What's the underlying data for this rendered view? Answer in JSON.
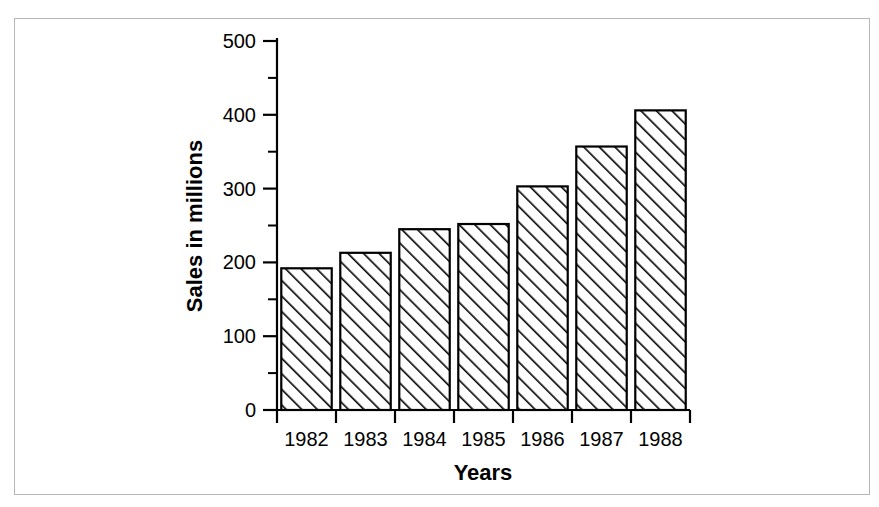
{
  "chart_data": {
    "type": "bar",
    "title": "",
    "xlabel": "Years",
    "ylabel": "Sales in millions",
    "categories": [
      "1982",
      "1983",
      "1984",
      "1985",
      "1986",
      "1987",
      "1988"
    ],
    "values": [
      192,
      213,
      245,
      252,
      303,
      357,
      406
    ],
    "ylim": [
      0,
      500
    ],
    "ytick_labels": [
      "0",
      "100",
      "200",
      "300",
      "400",
      "500"
    ],
    "ytick_values": [
      0,
      100,
      200,
      300,
      400,
      500
    ],
    "yminor_values": [
      50,
      150,
      250,
      350,
      450
    ],
    "grid": "off",
    "legend": "none",
    "bar_fill": "diagonal-hatch",
    "bar_edge_color": "#000000",
    "background_color": "#ffffff",
    "frame_color": "#b6b6b6"
  }
}
